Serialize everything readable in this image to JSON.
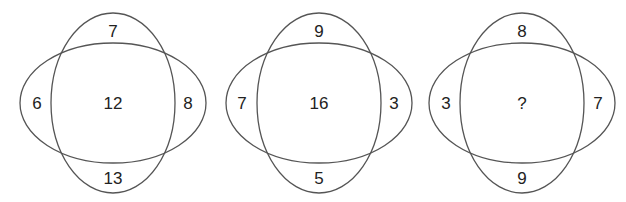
{
  "puzzle": {
    "description": "Number puzzle: three overlapping-ellipse diagrams, find the missing center value",
    "diagrams": [
      {
        "id": "diagram-1",
        "top": "7",
        "left": "6",
        "center": "12",
        "right": "8",
        "bottom": "13"
      },
      {
        "id": "diagram-2",
        "top": "9",
        "left": "7",
        "center": "16",
        "right": "3",
        "bottom": "5"
      },
      {
        "id": "diagram-3",
        "top": "8",
        "left": "3",
        "center": "?",
        "right": "7",
        "bottom": "9"
      }
    ]
  },
  "colors": {
    "stroke": "#555555",
    "text": "#222222",
    "background": "#ffffff"
  }
}
